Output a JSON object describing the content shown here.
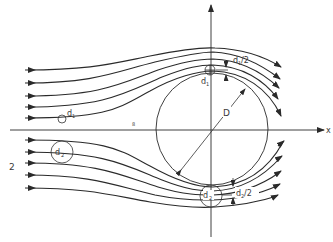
{
  "figure": {
    "labels": {
      "x_axis": "x",
      "diameter": "D",
      "particle_1": "d",
      "particle_1_sub": "1",
      "particle_2": "d",
      "particle_2_sub": "2",
      "half_d1": "d",
      "half_d1_sub": "1",
      "half_d1_suffix": "/2",
      "half_d2": "d",
      "half_d2_sub": "2",
      "half_d2_suffix": "/2",
      "side_number": "2",
      "small_mark": "8"
    },
    "colors": {
      "line": "#2a2a2a",
      "text": "#3a3a3a",
      "background": "#ffffff"
    },
    "streamlines_upper_count": 5,
    "streamlines_lower_count": 5
  }
}
